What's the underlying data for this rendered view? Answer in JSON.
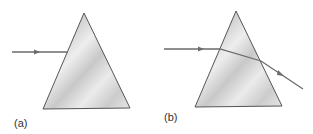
{
  "diagram": {
    "panels": [
      {
        "label": "(a)",
        "description": "Ray approaching prism face"
      },
      {
        "label": "(b)",
        "description": "Ray refracted through prism and exiting"
      }
    ],
    "colors": {
      "ray": "#6b6b6b",
      "prism_edge": "#555555",
      "prism_fill": "#d9d9d9"
    }
  }
}
